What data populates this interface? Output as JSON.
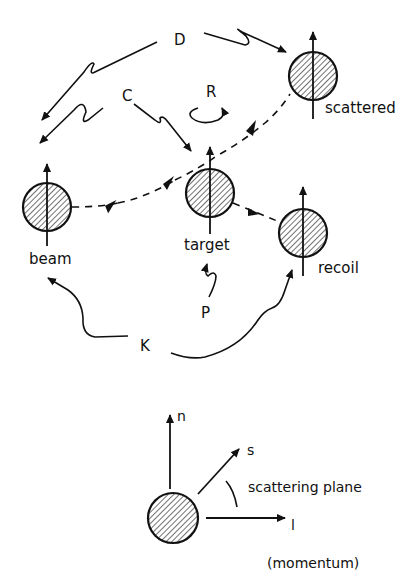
{
  "diagram": {
    "particles": [
      {
        "id": "beam",
        "label": "beam"
      },
      {
        "id": "target",
        "label": "target"
      },
      {
        "id": "scattered",
        "label": "scattered"
      },
      {
        "id": "recoil",
        "label": "recoil"
      }
    ],
    "observables": {
      "D": "D",
      "C": "C",
      "R": "R",
      "P": "P",
      "K": "K"
    },
    "frame": {
      "n": "n",
      "s": "s",
      "l": "l",
      "plane_label": "scattering plane",
      "momentum_label": "(momentum)"
    },
    "colors": {
      "ink": "#111111",
      "background": "#ffffff"
    }
  }
}
